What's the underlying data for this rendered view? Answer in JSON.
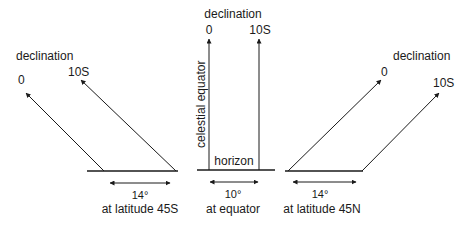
{
  "panels": [
    {
      "id": "south",
      "declination_title": "declination",
      "arrow_labels": [
        "0",
        "10S"
      ],
      "span_label": "14°",
      "caption": "at latitude 45S"
    },
    {
      "id": "equator",
      "declination_title": "declination",
      "arrow_labels": [
        "0",
        "10S"
      ],
      "axis_label": "celestial equator",
      "horizon_label": "horizon",
      "span_label": "10°",
      "caption": "at equator"
    },
    {
      "id": "north",
      "declination_title": "declination",
      "arrow_labels": [
        "0",
        "10S"
      ],
      "span_label": "14°",
      "caption": "at latitude 45N"
    }
  ],
  "colors": {
    "ink": "#1a1a1a",
    "background": "#ffffff"
  }
}
